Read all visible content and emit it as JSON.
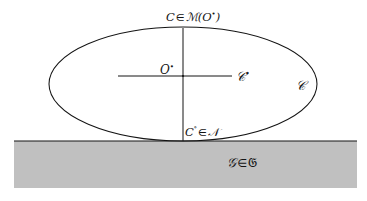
{
  "figure": {
    "background_color": "#ffffff",
    "stroke_color": "#141414"
  },
  "ground": {
    "fill_color": "#c0c0c0",
    "border_color": "#141414",
    "label": "\u0001",
    "label_script_g": "𝐢",
    "label_text": "𝒢 ∈ 𝔊",
    "label_lhs": "𝒢",
    "label_op": "∈",
    "label_rhs": "𝔊"
  },
  "ellipse": {
    "label": "𝒞",
    "center_label": "O",
    "center_superscript": "•"
  },
  "labels": {
    "curve_top": {
      "lhs": "C",
      "op": "∈",
      "set": "ℳ",
      "arg_open": "(",
      "arg": "O",
      "arg_superscript": "•",
      "arg_close": ")"
    },
    "origin": {
      "symbol": "O",
      "superscript": "•"
    },
    "contact_point": {
      "symbol": "𝒞",
      "superscript": "•"
    },
    "curve_name": {
      "symbol": "𝒞"
    },
    "curve_bottom": {
      "lhs": "C",
      "lhs_superscript": "°",
      "op": "∈",
      "rhs": "𝒩"
    },
    "ground_region": {
      "lhs": "𝒢",
      "op": "∈",
      "rhs": "𝔊"
    }
  },
  "geometry": {
    "ellipse_cx": 183,
    "ellipse_cy": 84,
    "ellipse_rx": 134,
    "ellipse_ry": 57,
    "ground_top_y": 141,
    "ground_bottom_y": 188,
    "ground_left_x": 14,
    "ground_right_x": 357,
    "vertical_axis_x": 183,
    "vertical_axis_top_y": 28,
    "vertical_axis_bottom_y": 141,
    "horizontal_axis_y": 76,
    "horizontal_axis_left_x": 118,
    "horizontal_axis_right_x": 232
  }
}
